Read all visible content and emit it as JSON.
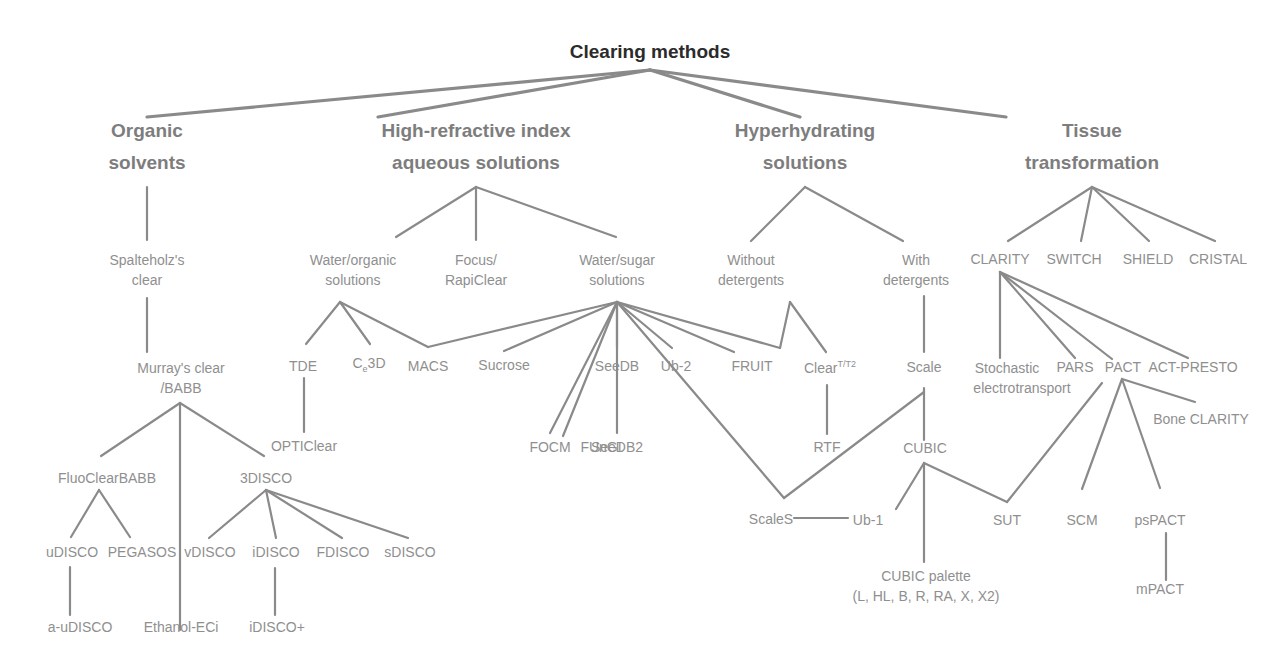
{
  "diagram": {
    "title": "Clearing methods",
    "line_color": "#8a8a8a",
    "text_color": "#8f8f8f",
    "title_color": "#2b2b2b",
    "categories": [
      {
        "id": "organic",
        "lines": [
          "Organic",
          "solvents"
        ]
      },
      {
        "id": "hri",
        "lines": [
          "High-refractive index",
          "aqueous solutions"
        ]
      },
      {
        "id": "hyper",
        "lines": [
          "Hyperhydrating",
          "solutions"
        ]
      },
      {
        "id": "tissue",
        "lines": [
          "Tissue",
          "transformation"
        ]
      }
    ],
    "nodes": {
      "spalteholz": [
        "Spalteholz's",
        "clear"
      ],
      "murray": [
        "Murray's clear",
        "/BABB"
      ],
      "fluoclearbabb": [
        "FluoClearBABB"
      ],
      "3disco": [
        "3DISCO"
      ],
      "udisco": [
        "uDISCO"
      ],
      "pegasos": [
        "PEGASOS"
      ],
      "vdisco": [
        "vDISCO"
      ],
      "idisco": [
        "iDISCO"
      ],
      "fdisco": [
        "FDISCO"
      ],
      "sdisco": [
        "sDISCO"
      ],
      "a_udisco": [
        "a-uDISCO"
      ],
      "ethanol_eci": [
        "Ethanol-ECi"
      ],
      "idisco_plus": [
        "iDISCO+"
      ],
      "water_organic": [
        "Water/organic",
        "solutions"
      ],
      "focus_rapiclear": [
        "Focus/",
        "RapiClear"
      ],
      "water_sugar": [
        "Water/sugar",
        "solutions"
      ],
      "tde": [
        "TDE"
      ],
      "c_e3d": {
        "base": "C",
        "sub": "e",
        "rest": "3D"
      },
      "macs": [
        "MACS"
      ],
      "sucrose": [
        "Sucrose"
      ],
      "seedb": [
        "SeeDB"
      ],
      "ub2": [
        "Ub-2"
      ],
      "fruit": [
        "FRUIT"
      ],
      "clear_t": {
        "base": "Clear",
        "sup": "T/T2"
      },
      "opticlear": [
        "OPTIClear"
      ],
      "focm": [
        "FOCM"
      ],
      "fungi": [
        "FUnGI"
      ],
      "seedb2": [
        "SeeDB2"
      ],
      "rtf": [
        "RTF"
      ],
      "without_det": [
        "Without",
        "detergents"
      ],
      "with_det": [
        "With",
        "detergents"
      ],
      "scale": [
        "Scale"
      ],
      "cubic": [
        "CUBIC"
      ],
      "scales": [
        "ScaleS"
      ],
      "ub1": [
        "Ub-1"
      ],
      "sut": [
        "SUT"
      ],
      "cubic_palette": [
        "CUBIC palette",
        "(L, HL, B, R, RA, X, X2)"
      ],
      "clarity": [
        "CLARITY"
      ],
      "switch": [
        "SWITCH"
      ],
      "shield": [
        "SHIELD"
      ],
      "cristal": [
        "CRISTAL"
      ],
      "stochastic": [
        "Stochastic",
        "electrotransport"
      ],
      "pars": [
        "PARS"
      ],
      "pact": [
        "PACT"
      ],
      "act_presto": [
        "ACT-PRESTO"
      ],
      "bone_clarity": [
        "Bone CLARITY"
      ],
      "scm": [
        "SCM"
      ],
      "pspact": [
        "psPACT"
      ],
      "mpact": [
        "mPACT"
      ]
    },
    "edges": [
      [
        650,
        70,
        147,
        117
      ],
      [
        650,
        70,
        378,
        117
      ],
      [
        650,
        70,
        800,
        117
      ],
      [
        650,
        70,
        1006,
        117
      ],
      [
        147,
        187,
        147,
        240
      ],
      [
        147,
        298,
        147,
        352
      ],
      [
        180,
        403,
        101,
        456
      ],
      [
        180,
        403,
        264,
        456
      ],
      [
        180,
        403,
        180,
        630
      ],
      [
        99,
        490,
        71,
        537
      ],
      [
        99,
        490,
        130,
        537
      ],
      [
        266,
        490,
        209,
        538
      ],
      [
        266,
        490,
        276,
        538
      ],
      [
        266,
        490,
        342,
        538
      ],
      [
        266,
        490,
        408,
        538
      ],
      [
        70,
        567,
        70,
        615
      ],
      [
        275,
        568,
        275,
        615
      ],
      [
        476,
        187,
        396,
        237
      ],
      [
        476,
        187,
        476,
        240
      ],
      [
        476,
        187,
        616,
        237
      ],
      [
        340,
        302,
        306,
        344
      ],
      [
        340,
        302,
        370,
        344
      ],
      [
        340,
        302,
        428,
        347
      ],
      [
        304,
        378,
        304,
        432
      ],
      [
        617,
        302,
        428,
        347
      ],
      [
        617,
        302,
        504,
        351
      ],
      [
        617,
        302,
        617,
        347
      ],
      [
        617,
        302,
        672,
        348
      ],
      [
        617,
        302,
        734,
        352
      ],
      [
        617,
        302,
        563,
        436
      ],
      [
        617,
        302,
        550,
        433
      ],
      [
        617,
        302,
        617,
        433
      ],
      [
        617,
        302,
        784,
        498
      ],
      [
        617,
        302,
        780,
        348
      ],
      [
        780,
        348,
        790,
        302
      ],
      [
        790,
        302,
        826,
        352
      ],
      [
        827,
        385,
        827,
        434
      ],
      [
        805,
        187,
        751,
        241
      ],
      [
        805,
        187,
        903,
        241
      ],
      [
        924,
        296,
        924,
        352
      ],
      [
        924,
        388,
        924,
        440
      ],
      [
        924,
        392,
        784,
        498
      ],
      [
        794,
        518,
        848,
        518
      ],
      [
        924,
        463,
        896,
        509
      ],
      [
        924,
        463,
        924,
        562
      ],
      [
        924,
        463,
        1007,
        502
      ],
      [
        1007,
        502,
        1102,
        383
      ],
      [
        1092,
        187,
        1008,
        241
      ],
      [
        1092,
        187,
        1081,
        241
      ],
      [
        1092,
        187,
        1149,
        241
      ],
      [
        1092,
        187,
        1215,
        241
      ],
      [
        1000,
        272,
        1000,
        358
      ],
      [
        1000,
        272,
        1075,
        358
      ],
      [
        1000,
        272,
        1112,
        359
      ],
      [
        1000,
        272,
        1188,
        358
      ],
      [
        1122,
        379,
        1082,
        489
      ],
      [
        1122,
        379,
        1195,
        402
      ],
      [
        1122,
        379,
        1160,
        488
      ],
      [
        1166,
        533,
        1166,
        580
      ]
    ]
  }
}
